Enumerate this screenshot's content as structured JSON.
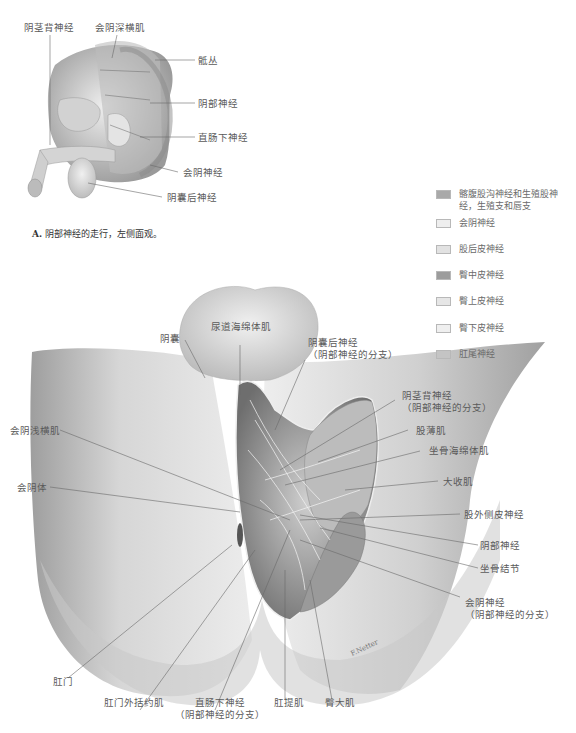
{
  "figure_a": {
    "caption_letter": "A.",
    "caption_text": "阴部神经的走行，左侧面观。",
    "labels": {
      "dorsal_penile_nerve": "阴茎背神经",
      "deep_transverse_perineal": "会阴深横肌",
      "sacral_plexus": "骶丛",
      "pudendal_nerve": "阴部神经",
      "inferior_rectal_nerve": "直肠下神经",
      "perineal_nerve": "会阴神经",
      "posterior_scrotal_nerve": "阴囊后神经"
    }
  },
  "legend": {
    "items": [
      {
        "label": "髂腹股沟神经和生殖股神经，生殖支和唇支",
        "color": "#a9a9a9"
      },
      {
        "label": "会阴神经",
        "color": "#eeeeee"
      },
      {
        "label": "股后皮神经",
        "color": "#e2e2e2"
      },
      {
        "label": "臀中皮神经",
        "color": "#9c9c9c"
      },
      {
        "label": "臀上皮神经",
        "color": "#e6e6e6"
      },
      {
        "label": "臀下皮神经",
        "color": "#efefef"
      },
      {
        "label": "肛尾神经",
        "color": "#c4c4c4"
      }
    ]
  },
  "figure_b": {
    "labels": {
      "scrotum": "阴囊",
      "bulbospongiosus": "尿道海绵体肌",
      "posterior_scrotal_nerve_1": "阴囊后神经",
      "posterior_scrotal_nerve_2": "（阴部神经的分支）",
      "dorsal_penile_nerve_1": "阴茎背神经",
      "dorsal_penile_nerve_2": "（阴部神经的分支）",
      "gracilis": "股薄肌",
      "ischiocavernosus": "坐骨海绵体肌",
      "adductor_magnus": "大收肌",
      "lateral_femoral_cutaneous": "股外侧皮神经",
      "pudendal_nerve": "阴部神经",
      "ischial_tuberosity": "坐骨结节",
      "perineal_nerve_1": "会阴神经",
      "perineal_nerve_2": "（阴部神经的分支）",
      "superficial_transverse_perineal": "会阴浅横肌",
      "perineal_body": "会阴体",
      "anus": "肛门",
      "external_anal_sphincter": "肛门外括约肌",
      "inferior_rectal_nerve_1": "直肠下神经",
      "inferior_rectal_nerve_2": "（阴部神经的分支）",
      "levator_ani": "肛提肌",
      "gluteus_maximus": "臀大肌"
    },
    "signature": "F.Netter"
  },
  "colors": {
    "skin_light": "#e4e4e4",
    "skin_mid": "#c8c8c8",
    "skin_dark": "#9a9a9a",
    "leader_line": "#6a6a6a"
  }
}
